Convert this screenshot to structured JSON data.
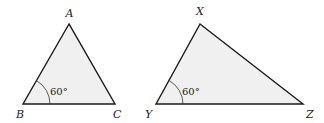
{
  "diagram": {
    "triangles": [
      {
        "name": "ABC",
        "vertices": {
          "A": "A",
          "B": "B",
          "C": "C"
        },
        "angle_label": "60°",
        "angle_at": "B"
      },
      {
        "name": "XYZ",
        "vertices": {
          "X": "X",
          "Y": "Y",
          "Z": "Z"
        },
        "angle_label": "60°",
        "angle_at": "Y"
      }
    ],
    "colors": {
      "fill": "#f0f0f0",
      "stroke": "#1a1a1a"
    }
  }
}
